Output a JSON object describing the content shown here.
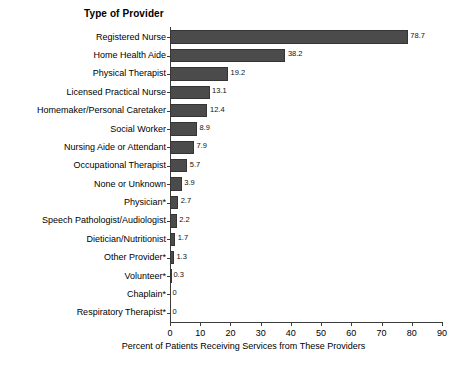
{
  "chart_data": {
    "type": "bar",
    "orientation": "horizontal",
    "title": "Type of Provider",
    "xlabel": "Percent of Patients Receiving Services from These Providers",
    "ylabel": "",
    "xlim": [
      0,
      90
    ],
    "xticks": [
      0,
      10,
      20,
      30,
      40,
      50,
      60,
      70,
      80,
      90
    ],
    "xtick_labels": [
      "0",
      "10",
      "20",
      "30",
      "40",
      "50",
      "60",
      "70",
      "80",
      "90"
    ],
    "grid": false,
    "legend": null,
    "bar_color": "#4b4b4b",
    "bar_edge_color": "#353535",
    "background_color": "#ffffff",
    "categories": [
      "Registered Nurse",
      "Home Health Aide",
      "Physical Therapist",
      "Licensed Practical Nurse",
      "Homemaker/Personal Caretaker",
      "Social Worker",
      "Nursing Aide or Attendant",
      "Occupational Therapist",
      "None or Unknown",
      "Physician*",
      "Speech Pathologist/Audiologist",
      "Dietician/Nutritionist",
      "Other Provider*",
      "Volunteer*",
      "Chaplain*",
      "Respiratory Therapist*"
    ],
    "values": [
      78.7,
      38.2,
      19.2,
      13.1,
      12.4,
      8.9,
      7.9,
      5.7,
      3.9,
      2.7,
      2.2,
      1.7,
      1.3,
      0.3,
      0,
      0
    ],
    "value_labels": [
      "78.7",
      "38.2",
      "19.2",
      "13.1",
      "12.4",
      "8.9",
      "7.9",
      "5.7",
      "3.9",
      "2.7",
      "2.2",
      "1.7",
      "1.3",
      "0.3",
      "0",
      "0"
    ]
  }
}
